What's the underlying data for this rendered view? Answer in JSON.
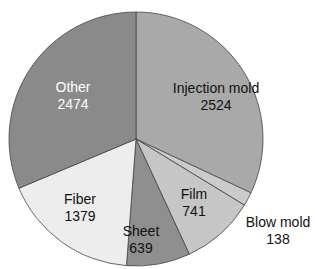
{
  "chart_data": {
    "type": "pie",
    "title": "",
    "start_angle_deg": 0,
    "direction": "clockwise",
    "total": 7895,
    "slices": [
      {
        "label": "Injection mold",
        "value": 2524,
        "color": "#a9a9a9",
        "text_color": "#111111"
      },
      {
        "label": "Blow mold",
        "value": 138,
        "color": "#cbcbcb",
        "text_color": "#111111"
      },
      {
        "label": "Film",
        "value": 741,
        "color": "#c6c6c6",
        "text_color": "#111111"
      },
      {
        "label": "Sheet",
        "value": 639,
        "color": "#8f8f8f",
        "text_color": "#111111"
      },
      {
        "label": "Fiber",
        "value": 1379,
        "color": "#ededed",
        "text_color": "#111111"
      },
      {
        "label": "Other",
        "value": 2474,
        "color": "#8a8a8a",
        "text_color": "#ffffff"
      }
    ],
    "labels": [
      {
        "name": "Injection mold",
        "value": "2524",
        "x": 216,
        "y": 97
      },
      {
        "name": "Blow mold",
        "value": "138",
        "x": 278,
        "y": 231
      },
      {
        "name": "Film",
        "value": "741",
        "x": 194,
        "y": 203
      },
      {
        "name": "Sheet",
        "value": "639",
        "x": 141,
        "y": 240
      },
      {
        "name": "Fiber",
        "value": "1379",
        "x": 80,
        "y": 208
      },
      {
        "name": "Other",
        "value": "2474",
        "x": 73,
        "y": 96
      }
    ]
  }
}
